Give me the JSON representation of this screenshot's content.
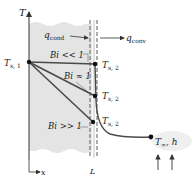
{
  "axes": {
    "y_label": "T",
    "x_label": "x",
    "wall_thickness_label": "L"
  },
  "heat_flow": {
    "conduction_label": "q",
    "conduction_sub": "cond",
    "convection_label": "q",
    "convection_sub": "conv"
  },
  "temperatures": {
    "surface1": "T",
    "surface1_sub": "s, 1",
    "surface2": "T",
    "surface2_sub": "s, 2"
  },
  "profiles": [
    {
      "label": "Bi << 1"
    },
    {
      "label": "Bi ≈ 1"
    },
    {
      "label": "Bi >> 1"
    }
  ],
  "fluid": {
    "label": "T",
    "label_sub": "∞",
    "coef": ", h"
  },
  "colors": {
    "slab": "#e4e4e4",
    "line": "#4a4a4a",
    "dash": "#777777"
  }
}
